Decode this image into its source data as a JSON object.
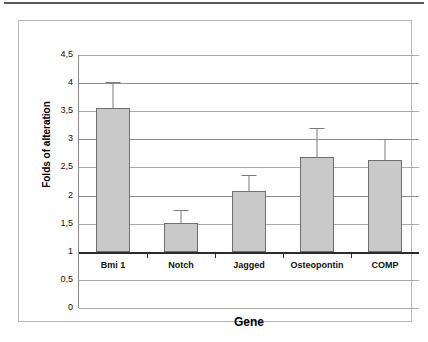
{
  "chart_data": {
    "type": "bar",
    "title": "",
    "xlabel": "Gene",
    "ylabel": "Folds of alteration",
    "categories": [
      "Bmi 1",
      "Notch",
      "Jagged",
      "Osteopontin",
      "COMP"
    ],
    "values": [
      3.55,
      1.52,
      2.08,
      2.68,
      2.64
    ],
    "errors_upper": [
      4.02,
      1.75,
      2.37,
      3.2,
      3.0
    ],
    "bar_baseline": 1,
    "ylim": [
      0,
      4.5
    ],
    "ytick_labels": [
      "4,5",
      "4",
      "3,5",
      "3",
      "2,5",
      "2",
      "1,5",
      "1",
      "0,5",
      "0"
    ],
    "ytick_values": [
      4.5,
      4,
      3.5,
      3,
      2.5,
      2,
      1.5,
      1,
      0.5,
      0
    ],
    "grid": true,
    "legend": "none",
    "decimal_separator": ",",
    "bar_fill_color": "#c9c9c9",
    "bar_border_color": "#6f6f6f",
    "gridline_color": "#aaaaaa",
    "axis_color": "#2b2b2b"
  }
}
